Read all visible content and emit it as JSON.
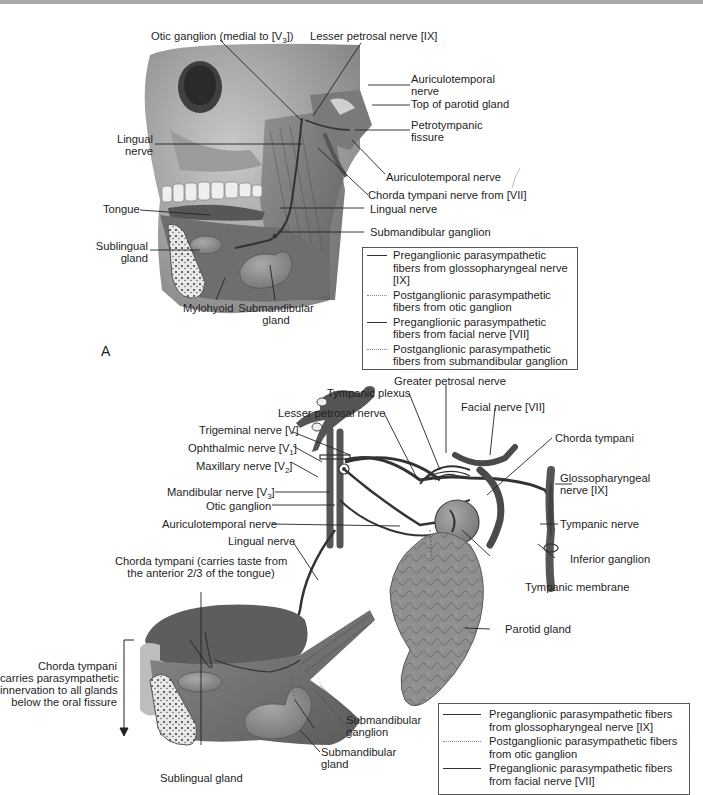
{
  "panel_a": {
    "letter": "A",
    "labels": {
      "otic_ganglion": "Otic ganglion (medial to [V",
      "otic_ganglion_sub": "3",
      "otic_ganglion_end": "])",
      "lesser_petrosal": "Lesser petrosal nerve [IX]",
      "auriculotemporal_top_1": "Auriculotemporal",
      "auriculotemporal_top_2": "nerve",
      "top_parotid": "Top of parotid gland",
      "petrotympanic_1": "Petrotympanic",
      "petrotympanic_2": "fissure",
      "lingual_left_1": "Lingual",
      "lingual_left_2": "nerve",
      "auriculotemporal_low": "Auriculotemporal nerve",
      "chorda_tympani": "Chorda tympani nerve from [VII]",
      "tongue": "Tongue",
      "lingual_right": "Lingual nerve",
      "submandibular_ganglion": "Submandibular ganglion",
      "sublingual_1": "Sublingual",
      "sublingual_2": "gland",
      "mylohyoid": "Mylohyoid",
      "submandibular_gland_1": "Submandibular",
      "submandibular_gland_2": "gland"
    },
    "legend": [
      {
        "style": "solid",
        "line1": "Preganglionic parasympathetic",
        "line2": "fibers  from glossopharyngeal nerve [IX]"
      },
      {
        "style": "dotted",
        "line1": "Postganglionic parasympathetic",
        "line2": "fibers from otic ganglion"
      },
      {
        "style": "solid",
        "line1": "Preganglionic parasympathetic",
        "line2": "fibers from facial nerve [VII]"
      },
      {
        "style": "dotted",
        "line1": "Postganglionic parasympathetic",
        "line2": "fibers from submandibular ganglion"
      }
    ]
  },
  "panel_b": {
    "labels": {
      "greater_petrosal": "Greater petrosal nerve",
      "tympanic_plexus": "Tympanic plexus",
      "facial_nerve": "Facial nerve [VII]",
      "lesser_petrosal": "Lesser petrosal nerve",
      "chorda_tympani": "Chorda tympani",
      "trigeminal": "Trigeminal nerve [V]",
      "ophthalmic": "Ophthalmic nerve [V",
      "ophthalmic_sub": "1",
      "maxillary": "Maxillary nerve [V",
      "maxillary_sub": "2",
      "mandibular": "Mandibular nerve [V",
      "mandibular_sub": "3",
      "close_bracket": "]",
      "glossopharyngeal_1": "Glossopharyngeal",
      "glossopharyngeal_2": "nerve [IX]",
      "otic_ganglion": "Otic ganglion",
      "auriculotemporal": "Auriculotemporal nerve",
      "tympanic_nerve": "Tympanic nerve",
      "inferior_ganglion": "Inferior ganglion",
      "lingual": "Lingual nerve",
      "chorda_taste_1": "Chorda tympani (carries taste from",
      "chorda_taste_2": "the anterior 2/3 of the tongue)",
      "tympanic_membrane": "Tympanic membrane",
      "parotid": "Parotid gland",
      "chorda_note_1": "Chorda tympani",
      "chorda_note_2": "carries parasympathetic",
      "chorda_note_3": "innervation to all glands",
      "chorda_note_4": "below the oral fissure",
      "submandibular_ganglion_1": "Submandibular",
      "submandibular_ganglion_2": "ganglion",
      "submandibular_gland_1": "Submandibular",
      "submandibular_gland_2": "gland",
      "sublingual": "Sublingual gland"
    },
    "legend": [
      {
        "style": "solid",
        "line1": "Preganglionic parasympathetic fibers",
        "line2": "from glossopharyngeal nerve [IX]"
      },
      {
        "style": "dotted",
        "line1": "Postganglionic parasympathetic fibers",
        "line2": "from otic ganglion"
      },
      {
        "style": "solid",
        "line1": "Preganglionic parasympathetic fibers",
        "line2": "from facial nerve [VII]"
      }
    ]
  }
}
